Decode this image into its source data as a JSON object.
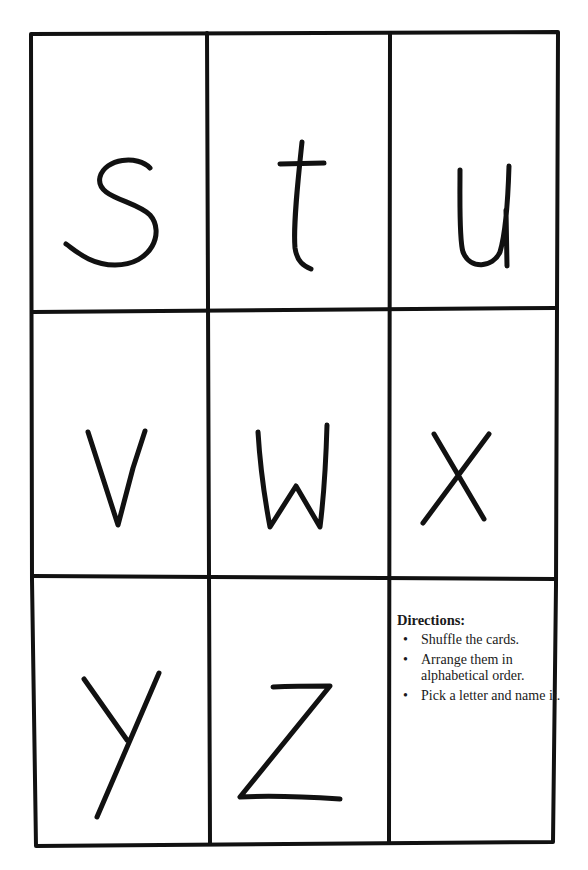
{
  "worksheet": {
    "cards": [
      {
        "letter": "s",
        "row": 0,
        "col": 0
      },
      {
        "letter": "t",
        "row": 0,
        "col": 1
      },
      {
        "letter": "u",
        "row": 0,
        "col": 2
      },
      {
        "letter": "v",
        "row": 1,
        "col": 0
      },
      {
        "letter": "w",
        "row": 1,
        "col": 1
      },
      {
        "letter": "x",
        "row": 1,
        "col": 2
      },
      {
        "letter": "y",
        "row": 2,
        "col": 0
      },
      {
        "letter": "z",
        "row": 2,
        "col": 1
      }
    ],
    "directions": {
      "title": "Directions:",
      "items": [
        "Shuffle the cards.",
        "Arrange them in alphabetical order.",
        "Pick a letter and name it."
      ]
    }
  },
  "colors": {
    "ink": "#111111",
    "paper": "#ffffff"
  }
}
